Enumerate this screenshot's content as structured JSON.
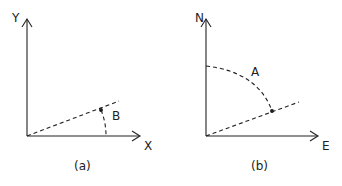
{
  "panel_a": {
    "caption": "(a)",
    "x_axis": "X",
    "y_axis": "Y",
    "angle_label": "B"
  },
  "panel_b": {
    "caption": "(b)",
    "x_axis": "E",
    "y_axis": "N",
    "angle_label": "A"
  },
  "colors": {
    "stroke": "#222222",
    "background": "#ffffff"
  }
}
